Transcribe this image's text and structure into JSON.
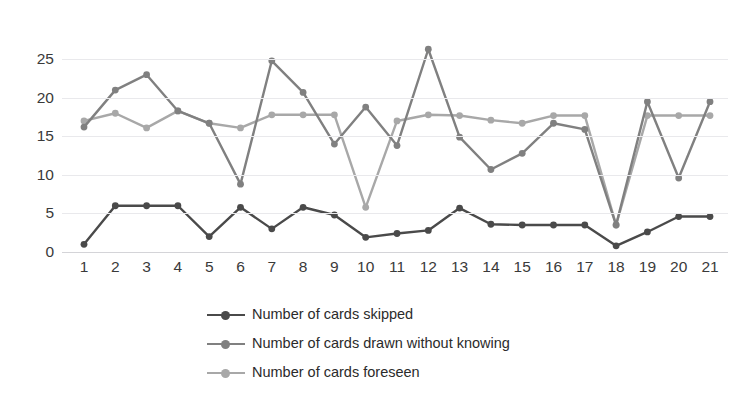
{
  "chart_data": {
    "type": "line",
    "title": "",
    "xlabel": "",
    "ylabel": "",
    "categories": [
      "1",
      "2",
      "3",
      "4",
      "5",
      "6",
      "7",
      "8",
      "9",
      "10",
      "11",
      "12",
      "13",
      "14",
      "15",
      "16",
      "17",
      "18",
      "19",
      "20",
      "21"
    ],
    "x_tick_labels": [
      "1",
      "2",
      "3",
      "4",
      "5",
      "6",
      "7",
      "8",
      "9",
      "10",
      "11",
      "12",
      "13",
      "14",
      "15",
      "16",
      "17",
      "18",
      "19",
      "20",
      "21"
    ],
    "y_tick_labels": [
      "0",
      "5",
      "10",
      "15",
      "20",
      "25"
    ],
    "y_ticks": [
      0,
      5,
      10,
      15,
      20,
      25
    ],
    "ylim": [
      0,
      27.5
    ],
    "grid": true,
    "legend_position": "bottom",
    "series": [
      {
        "name": "Number of cards skipped",
        "color": "#4a4a4a",
        "values": [
          1.0,
          6.0,
          6.0,
          6.0,
          2.0,
          5.8,
          3.0,
          5.8,
          4.8,
          1.9,
          2.4,
          2.8,
          5.7,
          3.6,
          3.5,
          3.5,
          3.5,
          0.8,
          2.6,
          4.6,
          4.6
        ]
      },
      {
        "name": "Number of cards drawn without knowing",
        "color": "#808080",
        "values": [
          16.2,
          21.0,
          23.0,
          18.3,
          16.7,
          8.8,
          24.8,
          20.7,
          14.0,
          18.8,
          13.8,
          26.3,
          14.9,
          10.7,
          12.8,
          16.7,
          15.9,
          3.5,
          19.5,
          9.6,
          19.5
        ]
      },
      {
        "name": "Number of cards foreseen",
        "color": "#a8a8a8",
        "values": [
          17.0,
          18.0,
          16.1,
          18.3,
          16.7,
          16.1,
          17.8,
          17.8,
          17.8,
          5.8,
          17.0,
          17.8,
          17.7,
          17.1,
          16.7,
          17.7,
          17.7,
          3.5,
          17.7,
          17.7,
          17.7
        ]
      }
    ]
  },
  "legend": {
    "items": [
      {
        "label": "Number of cards skipped",
        "color": "#4a4a4a"
      },
      {
        "label": "Number of cards drawn without knowing",
        "color": "#808080"
      },
      {
        "label": "Number of cards foreseen",
        "color": "#a8a8a8"
      }
    ]
  },
  "colors": {
    "background": "#ffffff",
    "gridline": "#e9e9ec",
    "axis": "#d4d4d8",
    "tick_text": "#3a3a3a",
    "legend_text": "#2b2b2b",
    "series_skipped": "#4a4a4a",
    "series_drawn": "#808080",
    "series_foreseen": "#a8a8a8"
  }
}
